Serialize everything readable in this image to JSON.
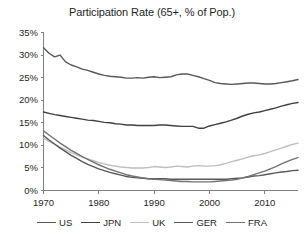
{
  "chart_data": {
    "type": "line",
    "title": "Participation Rate (65+, % of Pop.)",
    "xlabel": "",
    "ylabel": "",
    "xlim": [
      1970,
      2016
    ],
    "ylim": [
      0,
      35
    ],
    "grid": false,
    "legend_position": "bottom",
    "y_ticks": [
      "0%",
      "5%",
      "10%",
      "15%",
      "20%",
      "25%",
      "30%",
      "35%"
    ],
    "y_tick_values": [
      0,
      5,
      10,
      15,
      20,
      25,
      30,
      35
    ],
    "x_ticks": [
      "1970",
      "1980",
      "1990",
      "2000",
      "2010"
    ],
    "x_tick_values": [
      1970,
      1980,
      1990,
      2000,
      2010
    ],
    "x": [
      1970,
      1971,
      1972,
      1973,
      1974,
      1975,
      1976,
      1977,
      1978,
      1979,
      1980,
      1981,
      1982,
      1983,
      1984,
      1985,
      1986,
      1987,
      1988,
      1989,
      1990,
      1991,
      1992,
      1993,
      1994,
      1995,
      1996,
      1997,
      1998,
      1999,
      2000,
      2001,
      2002,
      2003,
      2004,
      2005,
      2006,
      2007,
      2008,
      2009,
      2010,
      2011,
      2012,
      2013,
      2014,
      2015,
      2016
    ],
    "series": [
      {
        "name": "US",
        "color": "#595959",
        "values": [
          31.6,
          30.4,
          29.6,
          30.0,
          28.5,
          27.8,
          27.4,
          26.9,
          26.6,
          26.2,
          25.8,
          25.5,
          25.3,
          25.2,
          25.1,
          24.9,
          24.9,
          25.0,
          24.9,
          25.1,
          25.2,
          25.0,
          25.1,
          25.2,
          25.6,
          25.8,
          25.8,
          25.5,
          25.2,
          24.8,
          24.4,
          23.9,
          23.7,
          23.6,
          23.5,
          23.6,
          23.7,
          23.8,
          23.8,
          23.7,
          23.6,
          23.6,
          23.7,
          23.9,
          24.1,
          24.3,
          24.6
        ]
      },
      {
        "name": "JPN",
        "color": "#404040",
        "values": [
          17.4,
          17.1,
          16.8,
          16.6,
          16.4,
          16.2,
          16.0,
          15.8,
          15.6,
          15.5,
          15.3,
          15.1,
          15.0,
          14.8,
          14.7,
          14.5,
          14.5,
          14.4,
          14.4,
          14.4,
          14.4,
          14.5,
          14.5,
          14.4,
          14.3,
          14.2,
          14.2,
          14.2,
          13.8,
          13.8,
          14.3,
          14.6,
          14.9,
          15.2,
          15.6,
          16.0,
          16.5,
          16.9,
          17.2,
          17.4,
          17.7,
          18.0,
          18.3,
          18.7,
          19.0,
          19.3,
          19.5
        ]
      },
      {
        "name": "UK",
        "color": "#bfbfbf",
        "values": [
          11.6,
          10.9,
          10.2,
          9.6,
          9.0,
          8.4,
          7.9,
          7.4,
          7.0,
          6.6,
          6.2,
          5.9,
          5.6,
          5.4,
          5.2,
          5.1,
          5.0,
          5.0,
          5.0,
          5.1,
          5.3,
          5.2,
          5.1,
          5.2,
          5.4,
          5.3,
          5.2,
          5.4,
          5.5,
          5.4,
          5.4,
          5.5,
          5.7,
          6.0,
          6.4,
          6.7,
          7.0,
          7.4,
          7.7,
          7.9,
          8.2,
          8.6,
          9.0,
          9.4,
          9.8,
          10.2,
          10.5
        ]
      },
      {
        "name": "GER",
        "color": "#595959",
        "values": [
          12.2,
          11.2,
          10.3,
          9.4,
          8.6,
          7.8,
          7.1,
          6.4,
          5.8,
          5.3,
          4.8,
          4.4,
          4.0,
          3.7,
          3.4,
          3.1,
          2.9,
          2.8,
          2.7,
          2.6,
          2.6,
          2.6,
          2.6,
          2.5,
          2.5,
          2.5,
          2.5,
          2.5,
          2.5,
          2.5,
          2.5,
          2.5,
          2.5,
          2.5,
          2.6,
          2.7,
          2.8,
          3.0,
          3.2,
          3.3,
          3.5,
          3.7,
          3.9,
          4.1,
          4.2,
          4.4,
          4.5
        ]
      },
      {
        "name": "FRA",
        "color": "#737373",
        "values": [
          13.2,
          12.3,
          11.4,
          10.5,
          9.7,
          8.9,
          8.2,
          7.5,
          6.9,
          6.3,
          5.7,
          5.2,
          4.7,
          4.3,
          3.9,
          3.5,
          3.2,
          3.0,
          2.8,
          2.6,
          2.5,
          2.4,
          2.3,
          2.2,
          2.1,
          2.0,
          2.0,
          1.9,
          1.9,
          1.9,
          1.9,
          2.0,
          2.1,
          2.2,
          2.3,
          2.5,
          2.8,
          3.1,
          3.5,
          3.9,
          4.3,
          4.8,
          5.3,
          5.9,
          6.4,
          6.9,
          7.3
        ]
      }
    ]
  },
  "legend": {
    "items": [
      {
        "label": "US",
        "color": "#595959"
      },
      {
        "label": "JPN",
        "color": "#404040"
      },
      {
        "label": "UK",
        "color": "#bfbfbf"
      },
      {
        "label": "GER",
        "color": "#595959"
      },
      {
        "label": "FRA",
        "color": "#737373"
      }
    ]
  },
  "axes": {
    "axis_color": "#808080"
  }
}
